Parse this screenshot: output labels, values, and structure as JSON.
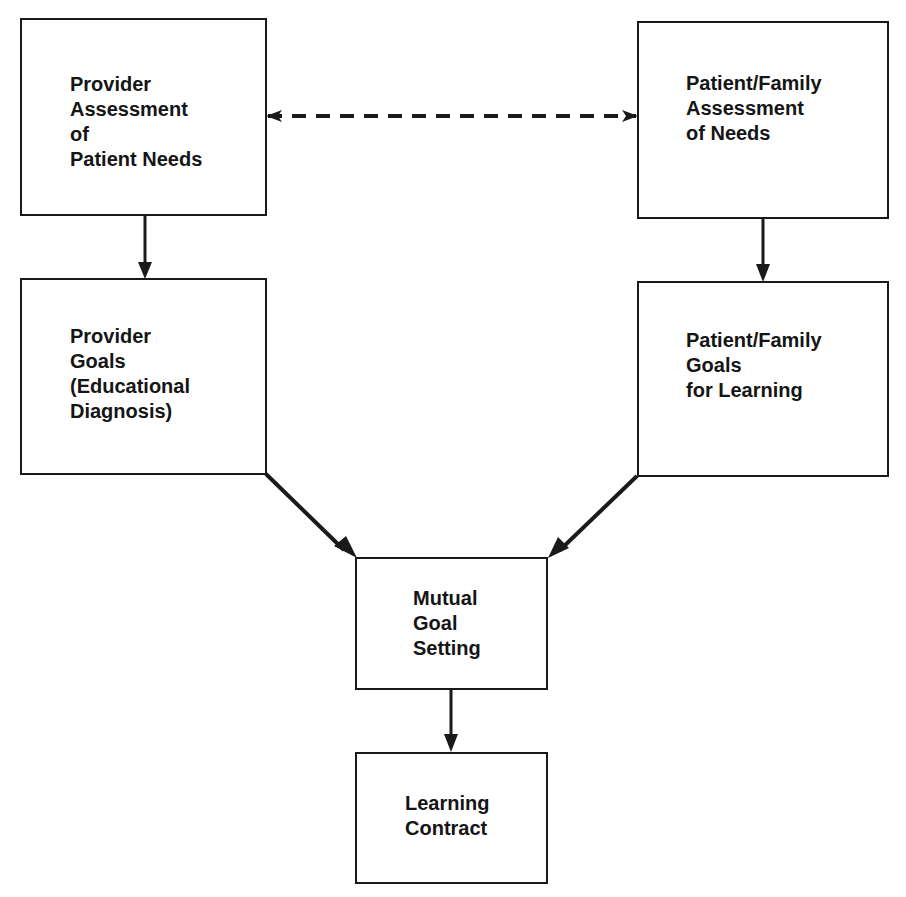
{
  "diagram": {
    "type": "flowchart",
    "colors": {
      "line": "#1a1a1a",
      "text": "#151515",
      "background": "#ffffff"
    },
    "nodes": [
      {
        "id": "provider_assessment",
        "lines": [
          "Provider",
          "Assessment",
          "of",
          "Patient Needs"
        ]
      },
      {
        "id": "patient_assessment",
        "lines": [
          "Patient/Family",
          "Assessment",
          "of Needs"
        ]
      },
      {
        "id": "provider_goals",
        "lines": [
          "Provider",
          "Goals",
          "(Educational",
          "Diagnosis)"
        ]
      },
      {
        "id": "patient_goals",
        "lines": [
          "Patient/Family",
          "Goals",
          "for Learning"
        ]
      },
      {
        "id": "mutual_goal_setting",
        "lines": [
          "Mutual",
          "Goal",
          "Setting"
        ]
      },
      {
        "id": "learning_contract",
        "lines": [
          "Learning",
          "Contract"
        ]
      }
    ],
    "edges": [
      {
        "from": "provider_assessment",
        "to": "patient_assessment",
        "style": "dashed",
        "direction": "bidirectional"
      },
      {
        "from": "provider_assessment",
        "to": "provider_goals",
        "style": "solid",
        "direction": "forward"
      },
      {
        "from": "patient_assessment",
        "to": "patient_goals",
        "style": "solid",
        "direction": "forward"
      },
      {
        "from": "provider_goals",
        "to": "mutual_goal_setting",
        "style": "solid",
        "direction": "forward"
      },
      {
        "from": "patient_goals",
        "to": "mutual_goal_setting",
        "style": "solid",
        "direction": "forward"
      },
      {
        "from": "mutual_goal_setting",
        "to": "learning_contract",
        "style": "solid",
        "direction": "forward"
      }
    ]
  },
  "labels": {
    "provider_assessment": "Provider\nAssessment\nof\nPatient Needs",
    "patient_assessment": "Patient/Family\nAssessment\nof Needs",
    "provider_goals": "Provider\nGoals\n(Educational\nDiagnosis)",
    "patient_goals": "Patient/Family\nGoals\nfor Learning",
    "mutual_goal_setting": "Mutual\nGoal\nSetting",
    "learning_contract": "Learning\nContract"
  }
}
